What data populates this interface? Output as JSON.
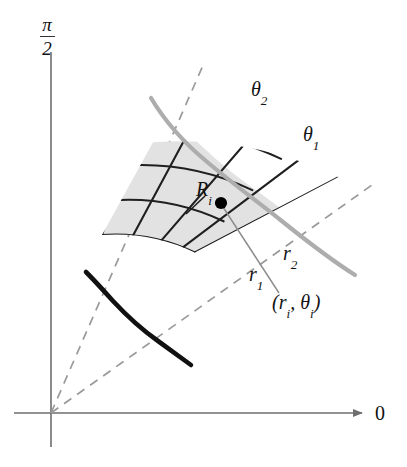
{
  "figure": {
    "kind": "polar-rectangle-diagram",
    "background": "#ffffff"
  },
  "axes": {
    "vertical_top_label_numerator": "π",
    "vertical_top_label_denominator": "2",
    "horizontal_right_label": "0",
    "axis_color": "#6e6e6e",
    "origin": {
      "x": 51,
      "y": 413
    }
  },
  "labels": {
    "theta2": "θ",
    "theta2_sub": "2",
    "theta1": "θ",
    "theta1_sub": "1",
    "r2": "r",
    "r2_sub": "2",
    "r1": "r",
    "r1_sub": "1",
    "subregion": "R",
    "subregion_sub": "i",
    "sample_point_open": "(",
    "sample_point_r": "r",
    "sample_point_r_sub": "i",
    "sample_point_comma": ",",
    "sample_point_theta": "θ",
    "sample_point_theta_sub": "i",
    "sample_point_close": ")"
  },
  "colors": {
    "shaded_region_fill": "#e2e2e2",
    "grid_line": "#1f1f1f",
    "dashed_ray": "#9a9a9a",
    "region_curve_gray": "#adadad",
    "region_curve_black": "#111111",
    "sample_dot": "#000000",
    "leader_line": "#8a8a8a"
  },
  "geometry": {
    "theta_outer_deg": 74,
    "theta_inner_deg": 39,
    "r_inner": 185,
    "r_outer": 370,
    "radial_divisions": 5,
    "angular_divisions": 4,
    "sample_dot": {
      "x": 221,
      "y": 203
    },
    "dashed_ray_theta2_end": {
      "x": 202,
      "y": 65
    },
    "dashed_ray_theta1_end": {
      "x": 370,
      "y": 186
    }
  }
}
